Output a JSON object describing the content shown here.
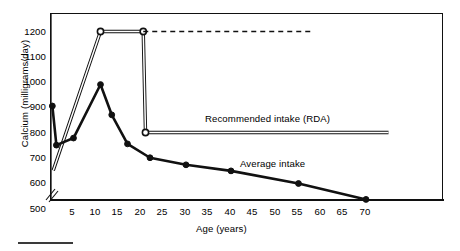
{
  "chart_data": {
    "type": "line",
    "title": "",
    "xlabel": "Age (years)",
    "ylabel": "Calcium (milligrams/day)",
    "xlim": [
      0,
      75
    ],
    "ylim": [
      500,
      1250
    ],
    "y_axis_break": true,
    "y_break_below": 600,
    "grid": false,
    "legend_position": "inline-annotations",
    "xticks": [
      5,
      10,
      15,
      20,
      25,
      30,
      35,
      40,
      45,
      50,
      55,
      60,
      65,
      70
    ],
    "yticks": [
      500,
      600,
      700,
      800,
      900,
      1000,
      1100,
      1200
    ],
    "series": [
      {
        "name": "Recommended intake (RDA)",
        "style": "thin-line-open-markers",
        "marker": "open-circle",
        "x": [
          0.5,
          11,
          20.5,
          21,
          75
        ],
        "values": [
          650,
          1200,
          1200,
          800,
          800
        ],
        "marker_at": [
          11,
          20.5,
          21
        ]
      },
      {
        "name": "RDA projection (dashed)",
        "style": "dashed",
        "x": [
          20.5,
          58
        ],
        "values": [
          1200,
          1200
        ]
      },
      {
        "name": "Average intake",
        "style": "thick-line-filled-markers",
        "marker": "filled-circle",
        "x": [
          0.3,
          1.2,
          5,
          11,
          13.5,
          17,
          22,
          30,
          40,
          55,
          70
        ],
        "values": [
          905,
          750,
          778,
          990,
          870,
          755,
          700,
          672,
          648,
          598,
          535
        ]
      }
    ],
    "annotations": [
      {
        "text": "Recommended intake (RDA)",
        "x": 36,
        "y": 845
      },
      {
        "text": "Average intake",
        "x": 44,
        "y": 690
      }
    ]
  },
  "axis": {
    "y_title": "Calcium (milligrams/day)",
    "x_title": "Age (years)",
    "y_ticks": [
      "1200",
      "1100",
      "1000",
      "900",
      "800",
      "700",
      "600",
      "500"
    ],
    "x_ticks": [
      "5",
      "10",
      "15",
      "20",
      "25",
      "30",
      "35",
      "40",
      "45",
      "50",
      "55",
      "60",
      "65",
      "70"
    ]
  },
  "labels": {
    "rda": "Recommended intake (RDA)",
    "average": "Average intake"
  },
  "colors": {
    "ink": "#111111",
    "background": "#ffffff"
  }
}
